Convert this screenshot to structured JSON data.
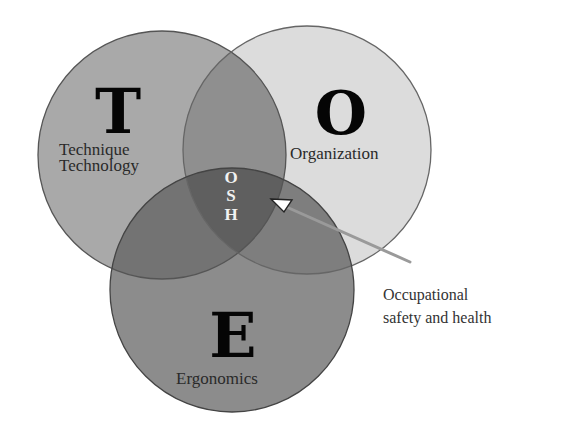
{
  "diagram": {
    "type": "venn",
    "circles": [
      {
        "id": "T",
        "letter": "T",
        "label_lines": [
          "Technique",
          "Technology"
        ],
        "fill": "#a9a9a9"
      },
      {
        "id": "O",
        "letter": "O",
        "label_lines": [
          "Organization"
        ],
        "fill": "#dcdcdc"
      },
      {
        "id": "E",
        "letter": "E",
        "label_lines": [
          "Ergonomics"
        ],
        "fill": "#8c8c8c"
      }
    ],
    "center": {
      "letters": [
        "O",
        "S",
        "H"
      ]
    },
    "annotation": {
      "lines": [
        "Occupational",
        "safety and health"
      ]
    }
  }
}
